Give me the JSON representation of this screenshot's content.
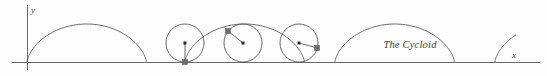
{
  "figure": {
    "caption": "The Cycloid",
    "caption_x": 410,
    "caption_y": 48,
    "width": 547,
    "height": 76,
    "background_color": "#fefefe",
    "curve_color": "#5a5a5a",
    "axis_color": "#6b6b6b",
    "marker_color": "#6e6e6e",
    "center_dot_color": "#2b2b2b"
  },
  "axes": {
    "x_axis": {
      "label": "x",
      "label_x": 512,
      "label_y": 58,
      "y_position": 62,
      "x_start": 12,
      "x_end": 540
    },
    "y_axis": {
      "label": "y",
      "label_x": 31,
      "label_y": 13,
      "x_position": 27,
      "y_start": 5,
      "y_end": 70
    }
  },
  "chart_data": {
    "type": "line",
    "title": "The Cycloid",
    "xlabel": "x",
    "ylabel": "y",
    "baseline_y": 62,
    "radius": 19,
    "arch_length": 119.38,
    "cusps_x": [
      27,
      185,
      335,
      495
    ],
    "arch_peaks": [
      {
        "x": 105,
        "y": 24
      },
      {
        "x": 260,
        "y": 24
      },
      {
        "x": 415,
        "y": 24
      }
    ],
    "arch_segments": [
      {
        "name": "arch-1",
        "theta_start": 0.0,
        "theta_end": 6.2832,
        "phase_offset": 0.0,
        "origin_x": 27
      },
      {
        "name": "arch-2",
        "theta_start": 0.0,
        "theta_end": 6.2832,
        "phase_offset": 0.0,
        "origin_x": 185
      },
      {
        "name": "arch-3",
        "theta_start": 0.0,
        "theta_end": 6.2832,
        "phase_offset": 0.0,
        "origin_x": 335
      },
      {
        "name": "arch-4-partial",
        "theta_start": 0.0,
        "theta_end": 2.0,
        "phase_offset": 0.0,
        "origin_x": 495
      }
    ],
    "generating_circles": [
      {
        "name": "circle-phase-0",
        "center_x": 185,
        "center_y": 43,
        "radius": 19,
        "trace_point_x": 185,
        "trace_point_y": 62,
        "trace_phase_deg": 360,
        "show_spoke": true
      },
      {
        "name": "circle-phase-1",
        "center_x": 243,
        "center_y": 43,
        "radius": 19,
        "trace_point_x": 228,
        "trace_point_y": 31,
        "trace_phase_deg": 128,
        "show_spoke": true
      },
      {
        "name": "circle-phase-2",
        "center_x": 299,
        "center_y": 43,
        "radius": 19,
        "trace_point_x": 317,
        "trace_point_y": 48,
        "trace_phase_deg": 255,
        "show_spoke": true
      }
    ],
    "trace_marker_size": 5,
    "center_marker_size": 3
  }
}
